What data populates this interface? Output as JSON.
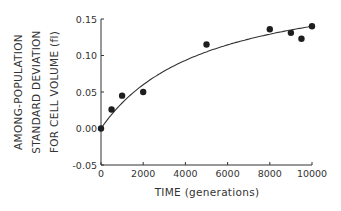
{
  "chart_data": {
    "type": "scatter",
    "title": "",
    "xlabel": "TIME (generations)",
    "ylabel_lines": [
      "AMONG-POPULATION",
      "STANDARD DEVIATION",
      "FOR CELL VOLUME (fl)"
    ],
    "xlim": [
      0,
      10000
    ],
    "ylim": [
      -0.05,
      0.15
    ],
    "x_ticks": [
      0,
      2000,
      4000,
      6000,
      8000,
      10000
    ],
    "x_tick_labels": [
      "0",
      "2000",
      "4000",
      "6000",
      "8000",
      "10000"
    ],
    "y_ticks": [
      -0.05,
      0.0,
      0.05,
      0.1,
      0.15
    ],
    "y_tick_labels": [
      "-0.05",
      "0.00",
      "0.05",
      "0.10",
      "0.15"
    ],
    "grid": false,
    "legend": null,
    "series": [
      {
        "name": "observed",
        "kind": "points",
        "x": [
          0,
          500,
          1000,
          2000,
          5000,
          8000,
          9000,
          9500,
          10000
        ],
        "y": [
          0.0,
          0.026,
          0.045,
          0.05,
          0.115,
          0.136,
          0.131,
          0.123,
          0.14
        ]
      },
      {
        "name": "fitted curve",
        "kind": "line",
        "model": "hyperbolic y = a*x/(b+x)",
        "a": 0.21,
        "b": 5000
      }
    ]
  }
}
